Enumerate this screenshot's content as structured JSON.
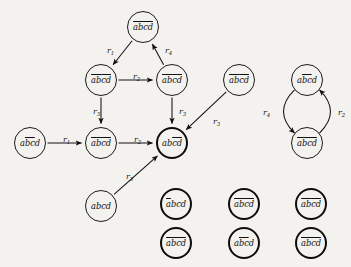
{
  "figure": {
    "kind": "directed-graph",
    "node_text": "abcd",
    "background": "#f4f2ee",
    "ink": "#111111"
  },
  "nodes": [
    {
      "id": "n-top",
      "label": "abcd",
      "bars": [
        [
          0,
          4
        ]
      ],
      "emphasis": "thin",
      "cx": 143,
      "cy": 27,
      "r": 16
    },
    {
      "id": "n-midleft",
      "label": "abcd",
      "bars": [
        [
          0,
          2
        ],
        [
          2,
          4
        ]
      ],
      "emphasis": "thin",
      "cx": 101,
      "cy": 80,
      "r": 16
    },
    {
      "id": "n-midright",
      "label": "abcd",
      "bars": [
        [
          0,
          2
        ],
        [
          2,
          4
        ]
      ],
      "emphasis": "thin",
      "cx": 172,
      "cy": 80,
      "r": 16
    },
    {
      "id": "n-isolated-r",
      "label": "abcd",
      "bars": [
        [
          0,
          2
        ],
        [
          2,
          4
        ]
      ],
      "emphasis": "thin",
      "cx": 239,
      "cy": 80,
      "r": 16
    },
    {
      "id": "n-cyc-top",
      "label": "abcd",
      "bars": [
        [
          1,
          3
        ]
      ],
      "emphasis": "thin",
      "cx": 307,
      "cy": 80,
      "r": 16
    },
    {
      "id": "n-left",
      "label": "abcd",
      "bars": [
        [
          1,
          3
        ]
      ],
      "emphasis": "thin",
      "cx": 30,
      "cy": 143,
      "r": 16
    },
    {
      "id": "n-row2",
      "label": "abcd",
      "bars": [
        [
          0,
          2
        ],
        [
          2,
          4
        ]
      ],
      "emphasis": "thin",
      "cx": 101,
      "cy": 143,
      "r": 16
    },
    {
      "id": "n-center",
      "label": "abcd",
      "bars": [
        [
          2,
          4
        ]
      ],
      "emphasis": "bold",
      "cx": 172,
      "cy": 143,
      "r": 16
    },
    {
      "id": "n-cyc-bot",
      "label": "abcd",
      "bars": [
        [
          0,
          4
        ]
      ],
      "emphasis": "thin",
      "cx": 307,
      "cy": 143,
      "r": 16
    },
    {
      "id": "n-bottomleft",
      "label": "abcd",
      "bars": [],
      "emphasis": "thin",
      "cx": 101,
      "cy": 206,
      "r": 16
    },
    {
      "id": "g-r1c1",
      "label": "abcd",
      "bars": [
        [
          0,
          1
        ]
      ],
      "emphasis": "bold",
      "cx": 176,
      "cy": 204,
      "r": 16
    },
    {
      "id": "g-r1c2",
      "label": "abcd",
      "bars": [
        [
          0,
          4
        ]
      ],
      "emphasis": "bold",
      "cx": 244,
      "cy": 204,
      "r": 16
    },
    {
      "id": "g-r1c3",
      "label": "abcd",
      "bars": [
        [
          0,
          2
        ],
        [
          2,
          4
        ]
      ],
      "emphasis": "bold",
      "cx": 311,
      "cy": 204,
      "r": 16
    },
    {
      "id": "g-r2c1",
      "label": "abcd",
      "bars": [
        [
          0,
          4
        ]
      ],
      "emphasis": "bold",
      "cx": 176,
      "cy": 243,
      "r": 16
    },
    {
      "id": "g-r2c2",
      "label": "abcd",
      "bars": [
        [
          1,
          3
        ]
      ],
      "emphasis": "bold",
      "cx": 244,
      "cy": 243,
      "r": 16
    },
    {
      "id": "g-r2c3",
      "label": "abcd",
      "bars": [
        [
          0,
          4
        ]
      ],
      "emphasis": "bold",
      "cx": 311,
      "cy": 243,
      "r": 16
    }
  ],
  "edges": [
    {
      "id": "e1",
      "from": "n-top",
      "to": "n-midleft",
      "label": "r",
      "sub": "1",
      "lx": 107,
      "ly": 46,
      "shape": "line"
    },
    {
      "id": "e2",
      "from": "n-midright",
      "to": "n-top",
      "label": "r",
      "sub": "4",
      "lx": 165,
      "ly": 46,
      "shape": "line"
    },
    {
      "id": "e3",
      "from": "n-midleft",
      "to": "n-midright",
      "label": "r",
      "sub": "2",
      "lx": 133,
      "ly": 72,
      "shape": "line"
    },
    {
      "id": "e4",
      "from": "n-midleft",
      "to": "n-row2",
      "label": "r",
      "sub": "3",
      "lx": 93,
      "ly": 107,
      "shape": "line"
    },
    {
      "id": "e5",
      "from": "n-midright",
      "to": "n-center",
      "label": "r",
      "sub": "3",
      "lx": 179,
      "ly": 107,
      "shape": "line"
    },
    {
      "id": "e6",
      "from": "n-left",
      "to": "n-row2",
      "label": "r",
      "sub": "1",
      "lx": 63,
      "ly": 135,
      "shape": "line"
    },
    {
      "id": "e7",
      "from": "n-row2",
      "to": "n-center",
      "label": "r",
      "sub": "2",
      "lx": 134,
      "ly": 135,
      "shape": "line"
    },
    {
      "id": "e8",
      "from": "n-isolated-r",
      "to": "n-center",
      "label": "r",
      "sub": "3",
      "lx": 213,
      "ly": 117,
      "shape": "line"
    },
    {
      "id": "e9",
      "from": "n-bottomleft",
      "to": "n-center",
      "label": "r",
      "sub": "3",
      "lx": 126,
      "ly": 172,
      "shape": "line"
    },
    {
      "id": "e10",
      "from": "n-cyc-top",
      "to": "n-cyc-bot",
      "label": "r",
      "sub": "4",
      "lx": 263,
      "ly": 108,
      "shape": "arc-left"
    },
    {
      "id": "e11",
      "from": "n-cyc-bot",
      "to": "n-cyc-top",
      "label": "r",
      "sub": "2",
      "lx": 338,
      "ly": 108,
      "shape": "arc-right"
    }
  ]
}
